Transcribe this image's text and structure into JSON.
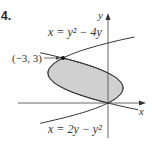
{
  "problem": {
    "number": "4."
  },
  "chart_data": {
    "type": "diagram",
    "axes": {
      "x_label": "x",
      "y_label": "y"
    },
    "curves": [
      {
        "name": "curve-1",
        "equation": "x = y² − 4y",
        "label": "x = y² − 4y"
      },
      {
        "name": "curve-2",
        "equation": "x = 2y − y²",
        "label": "x = 2y − y²"
      }
    ],
    "intersection_points": [
      {
        "x": -3,
        "y": 3,
        "label": "(−3, 3)"
      },
      {
        "x": 0,
        "y": 0,
        "label": ""
      }
    ],
    "shaded_region": {
      "between": [
        "x = y² − 4y",
        "x = 2y − y²"
      ],
      "y_range": [
        0,
        3
      ],
      "fill": "#d0d0d0"
    }
  },
  "labels": {
    "curve_top": "x = y² − 4y",
    "curve_bottom": "x = 2y − y²",
    "point": "(−3, 3)",
    "x_axis": "x",
    "y_axis": "y"
  },
  "colors": {
    "region_fill": "#d0d0d0",
    "stroke": "#333333"
  }
}
